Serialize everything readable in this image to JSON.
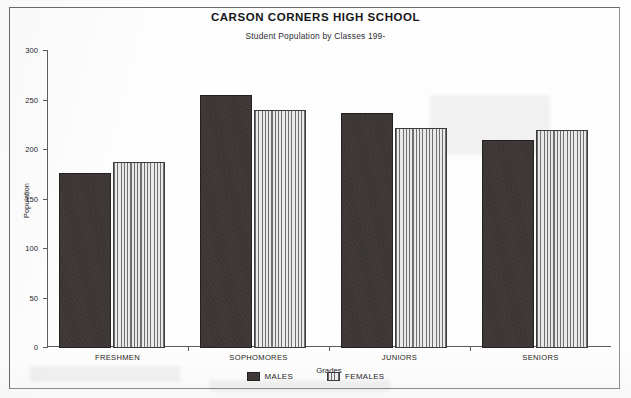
{
  "chart_data": {
    "type": "bar",
    "title": "CARSON CORNERS HIGH SCHOOL",
    "subtitle": "Student Population by Classes 199-",
    "xlabel": "Grades",
    "ylabel": "Population",
    "categories": [
      "FRESHMEN",
      "SOPHOMORES",
      "JUNIORS",
      "SENIORS"
    ],
    "series": [
      {
        "name": "MALES",
        "values": [
          177,
          256,
          237,
          210
        ],
        "swatch": "solid-dark",
        "color": "#3a3533"
      },
      {
        "name": "FEMALES",
        "values": [
          188,
          240,
          222,
          220
        ],
        "swatch": "vertical-stripes",
        "color": "#9a9a9d"
      }
    ],
    "ylim": [
      0,
      300
    ],
    "ytick_values": [
      0,
      50,
      100,
      150,
      200,
      250,
      300
    ],
    "ytick_labels": [
      "0",
      "50",
      "100",
      "150",
      "200",
      "250",
      "300"
    ],
    "grid": false,
    "legend_position": "bottom-center"
  }
}
